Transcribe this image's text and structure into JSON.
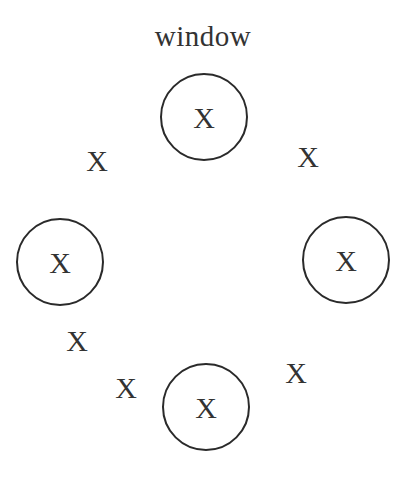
{
  "diagram": {
    "title": "window",
    "nodes": [
      {
        "id": "top",
        "label": "X",
        "cx": 204,
        "cy": 117
      },
      {
        "id": "left",
        "label": "X",
        "cx": 60,
        "cy": 262
      },
      {
        "id": "right",
        "label": "X",
        "cx": 346,
        "cy": 260
      },
      {
        "id": "bottom",
        "label": "X",
        "cx": 206,
        "cy": 407
      }
    ],
    "marks": [
      {
        "label": "X",
        "x": 97,
        "y": 161
      },
      {
        "label": "X",
        "x": 308,
        "y": 157
      },
      {
        "label": "X",
        "x": 77,
        "y": 341
      },
      {
        "label": "X",
        "x": 126,
        "y": 388
      },
      {
        "label": "X",
        "x": 296,
        "y": 373
      }
    ]
  }
}
